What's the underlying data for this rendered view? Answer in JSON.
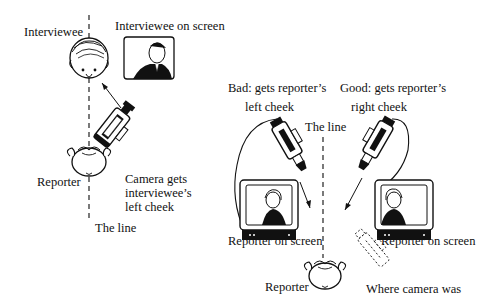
{
  "diagram": {
    "title": "",
    "left_panel": {
      "labels": {
        "interviewee": "Interviewee",
        "interviewee_on_screen": "Interviewee on screen",
        "reporter": "Reporter",
        "camera_note_line1": "Camera gets",
        "camera_note_line2": "interviewee’s",
        "camera_note_line3": "left cheek",
        "the_line": "The line"
      }
    },
    "right_panel": {
      "labels": {
        "bad_line1": "Bad: gets reporter’s",
        "bad_line2": "left cheek",
        "good_line1": "Good: gets reporter’s",
        "good_line2": "right cheek",
        "the_line": "The line",
        "reporter_on_screen_bad": "Reporter on screen",
        "reporter_on_screen_good": "Reporter on screen",
        "reporter": "Reporter",
        "where_camera_was": "Where camera was"
      }
    }
  }
}
